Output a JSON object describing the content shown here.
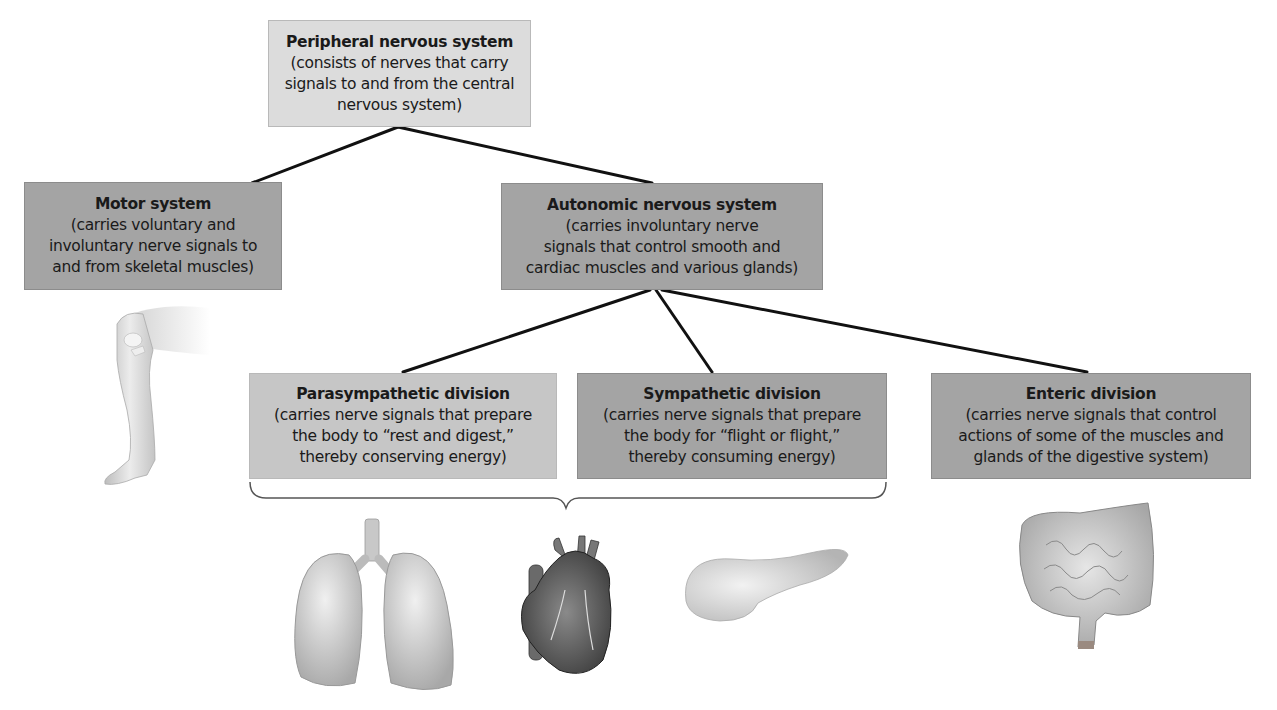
{
  "diagram": {
    "type": "hierarchy",
    "root": {
      "title": "Peripheral nervous system",
      "desc_lines": [
        "(consists of nerves that carry",
        "signals to and from the central",
        "nervous system)"
      ]
    },
    "level1": [
      {
        "title": "Motor system",
        "desc_lines": [
          "(carries voluntary and",
          "involuntary nerve signals to",
          "and from skeletal muscles)"
        ],
        "illustration": "leg-icon"
      },
      {
        "title": "Autonomic nervous system",
        "desc_lines": [
          "(carries involuntary nerve",
          "signals that control smooth and",
          "cardiac muscles and various glands)"
        ]
      }
    ],
    "level2": [
      {
        "title": "Parasympathetic division",
        "desc_lines": [
          "(carries nerve signals that prepare",
          "the body to “rest and digest,”",
          "thereby conserving energy)"
        ]
      },
      {
        "title": "Sympathetic division",
        "desc_lines": [
          "(carries nerve signals that prepare",
          "the body for “flight or flight,”",
          "thereby consuming energy)"
        ]
      },
      {
        "title": "Enteric division",
        "desc_lines": [
          "(carries nerve signals that control",
          "actions of some of the muscles and",
          "glands of the digestive system)"
        ],
        "illustration": "intestines-icon"
      }
    ],
    "bracket_illustrations": [
      "lungs-icon",
      "heart-icon",
      "pancreas-icon"
    ]
  },
  "colors": {
    "root_box": "#dcdcdc",
    "motor_box": "#a4a4a4",
    "autonomic_box": "#a4a4a4",
    "parasympathetic_box": "#c6c6c6",
    "sympathetic_box": "#a4a4a4",
    "enteric_box": "#a4a4a4",
    "connector": "#111111"
  }
}
